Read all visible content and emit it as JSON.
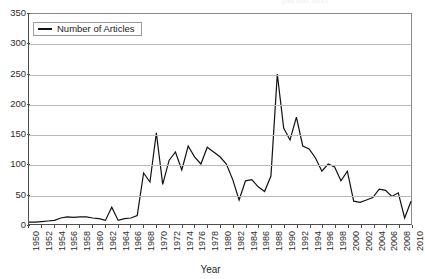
{
  "cut_title": "partial text",
  "legend": {
    "label": "Number of Articles",
    "position": "top-left-inside"
  },
  "axis": {
    "x_title": "Year",
    "y_title": ""
  },
  "colors": {
    "series": "#111111",
    "gridline": "#b9b9b9",
    "axis": "#4d4d4d",
    "background": "#ffffff"
  },
  "chart_data": {
    "type": "line",
    "title": "",
    "subtitle": "",
    "xlabel": "Year",
    "ylabel": "",
    "xlim": [
      1950,
      2010
    ],
    "ylim": [
      0,
      350
    ],
    "ytick_step": 50,
    "xtick_step": 2,
    "grid": true,
    "legend_position": "top-left-inside",
    "yticks": [
      0,
      50,
      100,
      150,
      200,
      250,
      300,
      350
    ],
    "xticks": [
      1950,
      1952,
      1954,
      1956,
      1958,
      1960,
      1962,
      1964,
      1966,
      1968,
      1970,
      1972,
      1974,
      1976,
      1978,
      1980,
      1982,
      1984,
      1986,
      1988,
      1990,
      1992,
      1994,
      1996,
      1998,
      2000,
      2002,
      2004,
      2006,
      2008,
      2010
    ],
    "categories": [
      1950,
      1951,
      1952,
      1953,
      1954,
      1955,
      1956,
      1957,
      1958,
      1959,
      1960,
      1961,
      1962,
      1963,
      1964,
      1965,
      1966,
      1967,
      1968,
      1969,
      1970,
      1971,
      1972,
      1973,
      1974,
      1975,
      1976,
      1977,
      1978,
      1979,
      1980,
      1981,
      1982,
      1983,
      1984,
      1985,
      1986,
      1987,
      1988,
      1989,
      1990,
      1991,
      1992,
      1993,
      1994,
      1995,
      1996,
      1997,
      1998,
      1999,
      2000,
      2001,
      2002,
      2003,
      2004,
      2005,
      2006,
      2007,
      2008,
      2009,
      2010
    ],
    "series": [
      {
        "name": "Number of Articles",
        "values": [
          3,
          3,
          4,
          5,
          6,
          10,
          12,
          11,
          12,
          12,
          10,
          9,
          6,
          28,
          6,
          9,
          10,
          14,
          85,
          70,
          152,
          66,
          106,
          120,
          90,
          130,
          112,
          100,
          128,
          120,
          112,
          100,
          74,
          40,
          72,
          74,
          62,
          54,
          80,
          250,
          160,
          140,
          178,
          130,
          125,
          110,
          88,
          100,
          95,
          72,
          88,
          38,
          36,
          40,
          44,
          58,
          56,
          46,
          52,
          10,
          38
        ]
      }
    ]
  }
}
